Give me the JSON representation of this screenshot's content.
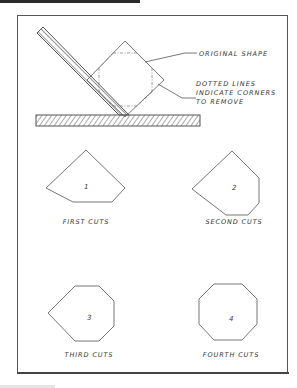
{
  "diagram": {
    "annotations": {
      "original_shape": "ORIGINAL SHAPE",
      "dotted_lines_1": "DOTTED LINES",
      "dotted_lines_2": "INDICATE CORNERS",
      "dotted_lines_3": "TO REMOVE"
    },
    "steps": [
      {
        "number": "1",
        "caption": "FIRST CUTS"
      },
      {
        "number": "2",
        "caption": "SECOND CUTS"
      },
      {
        "number": "3",
        "caption": "THIRD CUTS"
      },
      {
        "number": "4",
        "caption": "FOURTH CUTS"
      }
    ],
    "colors": {
      "line": "#555555",
      "text": "#333333",
      "background": "#ffffff"
    }
  }
}
